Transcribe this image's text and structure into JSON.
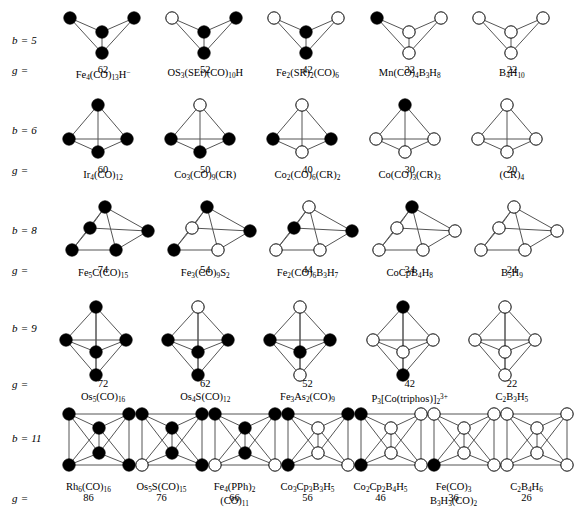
{
  "figure": {
    "axis_labels": {
      "b_prefix": "b =",
      "g_prefix": "g ="
    },
    "vertex_legend": {
      "filled": "transition-metal vertex",
      "open": "main-group vertex"
    },
    "colors": {
      "filled_vertex": "#000000",
      "open_vertex": "#ffffff",
      "edge": "#555555",
      "text": "#000000"
    }
  },
  "rows": [
    {
      "id": "row-b5",
      "b_label": "b = 5",
      "b_value": 5,
      "g_label": "g =",
      "shape": "trigonal-pyramid",
      "cells": [
        {
          "formula_html": "Fe<sub>4</sub>(CO)<sub>13</sub>H<sup>&minus;</sup>",
          "formula_text": "Fe4(CO)13H-",
          "count": "62",
          "filled": [
            1,
            1,
            1,
            1
          ]
        },
        {
          "formula_html": "OS<sub>3</sub>(SEt)(CO)<sub>10</sub>H",
          "formula_text": "OS3(SEt)(CO)10H",
          "count": "52",
          "filled": [
            0,
            1,
            1,
            1
          ]
        },
        {
          "formula_html": "Fe<sub>2</sub>(SR)<sub>2</sub>(CO)<sub>6</sub>",
          "formula_text": "Fe2(SR)2(CO)6",
          "count": "42",
          "filled": [
            0,
            0,
            1,
            1
          ]
        },
        {
          "formula_html": "Mn(CO)<sub>4</sub>B<sub>3</sub>H<sub>8</sub>",
          "formula_text": "Mn(CO)4B3H8",
          "count": "32",
          "filled": [
            1,
            0,
            0,
            0
          ]
        },
        {
          "formula_html": "B<sub>4</sub>H<sub>10</sub>",
          "formula_text": "B4H10",
          "count": "22",
          "filled": [
            0,
            0,
            0,
            0
          ]
        }
      ]
    },
    {
      "id": "row-b6",
      "b_label": "b = 6",
      "b_value": 6,
      "g_label": "g =",
      "shape": "tetrahedron",
      "cells": [
        {
          "formula_html": "Ir<sub>4</sub>(CO)<sub>12</sub>",
          "formula_text": "Ir4(CO)12",
          "count": "60",
          "filled": [
            1,
            1,
            1,
            1
          ]
        },
        {
          "formula_html": "Co<sub>3</sub>(CO)<sub>9</sub>(CR)",
          "formula_text": "Co3(CO)9(CR)",
          "count": "50",
          "filled": [
            0,
            1,
            1,
            1
          ]
        },
        {
          "formula_html": "Co<sub>2</sub>(CO)<sub>6</sub>(CR)<sub>2</sub>",
          "formula_text": "Co2(CO)6(CR)2",
          "count": "40",
          "filled": [
            0,
            1,
            1,
            0
          ]
        },
        {
          "formula_html": "Co(CO)<sub>3</sub>(CR)<sub>3</sub>",
          "formula_text": "Co(CO)3(CR)3",
          "count": "30",
          "filled": [
            1,
            0,
            0,
            0
          ]
        },
        {
          "formula_html": "(CR)<sub>4</sub>",
          "formula_text": "(CR)4",
          "count": "20",
          "filled": [
            0,
            0,
            0,
            0
          ]
        }
      ]
    },
    {
      "id": "row-b8",
      "b_label": "b = 8",
      "b_value": 8,
      "g_label": "g =",
      "shape": "square-pyramid",
      "cells": [
        {
          "formula_html": "Fe<sub>5</sub>C(CO)<sub>15</sub>",
          "formula_text": "Fe5C(CO)15",
          "count": "74",
          "filled": [
            1,
            1,
            1,
            1,
            1
          ]
        },
        {
          "formula_html": "Fe<sub>3</sub>(CO)<sub>9</sub>S<sub>2</sub>",
          "formula_text": "Fe3(CO)9S2",
          "count": "54",
          "filled": [
            1,
            0,
            1,
            1,
            0
          ]
        },
        {
          "formula_html": "Fe<sub>2</sub>(CO)<sub>6</sub>B<sub>3</sub>H<sub>7</sub>",
          "formula_text": "Fe2(CO)6B3H7",
          "count": "44",
          "filled": [
            0,
            1,
            1,
            0,
            0
          ]
        },
        {
          "formula_html": "CoCpB<sub>4</sub>H<sub>8</sub>",
          "formula_text": "CoCpB4H8",
          "count": "34",
          "filled": [
            1,
            0,
            0,
            0,
            0
          ]
        },
        {
          "formula_html": "B<sub>5</sub>H<sub>9</sub>",
          "formula_text": "B5H9",
          "count": "24",
          "filled": [
            0,
            0,
            0,
            0,
            0
          ]
        }
      ]
    },
    {
      "id": "row-b9",
      "b_label": "b = 9",
      "b_value": 9,
      "g_label": "g =",
      "shape": "trigonal-bipyramid",
      "cells": [
        {
          "formula_html": "Os<sub>5</sub>(CO)<sub>16</sub>",
          "formula_text": "Os5(CO)16",
          "count": "72",
          "filled": [
            1,
            1,
            1,
            1,
            1
          ]
        },
        {
          "formula_html": "Os<sub>4</sub>S(CO)<sub>12</sub>",
          "formula_text": "Os4S(CO)12",
          "count": "62",
          "filled": [
            0,
            1,
            1,
            1,
            1
          ]
        },
        {
          "formula_html": "Fe<sub>3</sub>As<sub>2</sub>(CO)<sub>9</sub>",
          "formula_text": "Fe3As2(CO)9",
          "count": "52",
          "filled": [
            0,
            1,
            1,
            1,
            0
          ]
        },
        {
          "formula_html": "P<sub>3</sub>[Co(triphos)]<sub>2</sub><sup>3+</sup>",
          "formula_text": "P3[Co(triphos)]2 3+",
          "count": "42",
          "filled": [
            1,
            0,
            0,
            0,
            1
          ]
        },
        {
          "formula_html": "C<sub>2</sub>B<sub>3</sub>H<sub>5</sub>",
          "formula_text": "C2B3H5",
          "count": "22",
          "filled": [
            0,
            0,
            0,
            0,
            0
          ]
        }
      ]
    },
    {
      "id": "row-b11",
      "b_label": "b = 11",
      "b_value": 11,
      "g_label": "g =",
      "shape": "octahedron",
      "cells": [
        {
          "formula_html": "Rh<sub>6</sub>(CO)<sub>16</sub>",
          "formula_text": "Rh6(CO)16",
          "count": "86",
          "filled": [
            1,
            1,
            1,
            1,
            1,
            1
          ]
        },
        {
          "formula_html": "Os<sub>5</sub>S(CO)<sub>15</sub>",
          "formula_text": "Os5S(CO)15",
          "count": "76",
          "filled": [
            1,
            1,
            1,
            1,
            0,
            1
          ]
        },
        {
          "formula_html": "Fe<sub>4</sub>(PPh)<sub>2</sub><span class=\"stack\">(CO)<sub>11</sub></span>",
          "formula_text": "Fe4(PPh)2(CO)11",
          "count": "66",
          "filled": [
            1,
            1,
            1,
            1,
            0,
            0
          ]
        },
        {
          "formula_html": "Co<sub>3</sub>Cp<sub>3</sub>B<sub>3</sub>H<sub>5</sub>",
          "formula_text": "Co3Cp3B3H5",
          "count": "56",
          "filled": [
            1,
            1,
            0,
            0,
            1,
            0
          ]
        },
        {
          "formula_html": "Co<sub>2</sub>Cp<sub>2</sub>B<sub>4</sub>H<sub>5</sub>",
          "formula_text": "Co2Cp2B4H5",
          "count": "46",
          "filled": [
            1,
            0,
            0,
            0,
            1,
            0
          ]
        },
        {
          "formula_html": "Fe(CO)<sub>3</sub><span class=\"stack\">B<sub>3</sub>H<sub>3</sub>(CO)<sub>2</sub></span>",
          "formula_text": "Fe(CO)3B3H3(CO)2",
          "count": "36",
          "filled": [
            0,
            0,
            0,
            0,
            1,
            0
          ]
        },
        {
          "formula_html": "C<sub>2</sub>B<sub>4</sub>H<sub>6</sub>",
          "formula_text": "C2B4H6",
          "count": "26",
          "filled": [
            0,
            0,
            0,
            0,
            0,
            0
          ]
        }
      ]
    }
  ]
}
